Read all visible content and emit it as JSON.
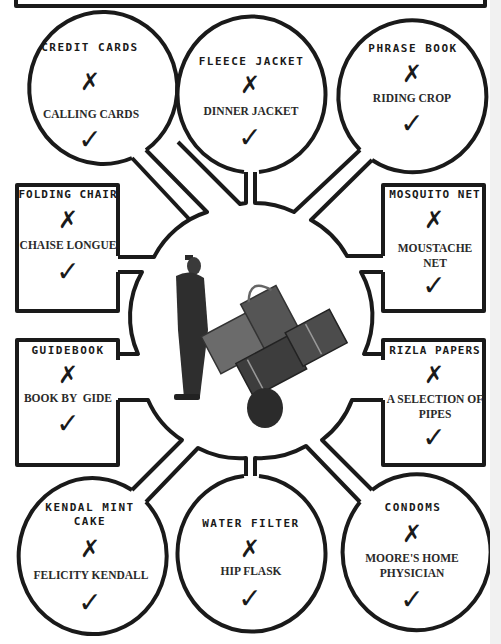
{
  "diagram": {
    "center_image": "porter-with-luggage-trolley",
    "cross_symbol": "✗",
    "check_symbol": "✓",
    "colors": {
      "line": "#1a1a1a",
      "background": "#ffffff"
    },
    "nodes": [
      {
        "id": "credit-cards",
        "shape": "circle",
        "item": "CREDIT CARDS",
        "alternative": "CALLING CARDS"
      },
      {
        "id": "fleece-jacket",
        "shape": "circle",
        "item": "FLEECE JACKET",
        "alternative": "DINNER JACKET"
      },
      {
        "id": "phrase-book",
        "shape": "circle",
        "item": "PHRASE BOOK",
        "alternative": "RIDING CROP"
      },
      {
        "id": "folding-chair",
        "shape": "box",
        "item": "FOLDING CHAIR",
        "alternative": "CHAISE LONGUE"
      },
      {
        "id": "mosquito-net",
        "shape": "box",
        "item": "MOSQUITO NET",
        "alternative_lines": [
          "MOUSTACHE",
          "NET"
        ]
      },
      {
        "id": "guidebook",
        "shape": "box",
        "item": "GUIDEBOOK",
        "alternative": "BOOK BY  GIDE"
      },
      {
        "id": "rizla-papers",
        "shape": "box",
        "item": "RIZLA PAPERS",
        "alternative_lines": [
          "A SELECTION OF",
          "PIPES"
        ]
      },
      {
        "id": "kendal-mint-cake",
        "shape": "circle",
        "item_lines": [
          "KENDAL MINT",
          "CAKE"
        ],
        "alternative": "FELICITY KENDALL"
      },
      {
        "id": "water-filter",
        "shape": "circle",
        "item": "WATER FILTER",
        "alternative": "HIP FLASK"
      },
      {
        "id": "condoms",
        "shape": "circle",
        "item": "CONDOMS",
        "alternative_lines": [
          "MOORE'S HOME",
          "PHYSICIAN"
        ]
      }
    ]
  }
}
